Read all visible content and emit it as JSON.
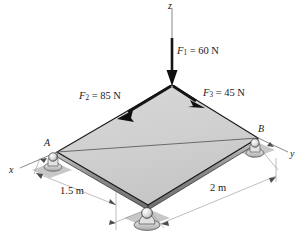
{
  "figure": {
    "axes": {
      "z_label": "z",
      "x_label": "x",
      "y_label": "y"
    },
    "points": [
      {
        "id": "A",
        "label": "A"
      },
      {
        "id": "B",
        "label": "B"
      }
    ],
    "forces": [
      {
        "id": "F1",
        "symbol": "F",
        "subscript": "1",
        "equals": " = ",
        "magnitude": "60",
        "unit": "N",
        "label": "F1 = 60 N",
        "direction": "downward along z"
      },
      {
        "id": "F2",
        "symbol": "F",
        "subscript": "2",
        "equals": " = ",
        "magnitude": "85",
        "unit": "N",
        "label": "F2 = 85 N",
        "direction": "down-left along plate edge"
      },
      {
        "id": "F3",
        "symbol": "F",
        "subscript": "3",
        "equals": " = ",
        "magnitude": "45",
        "unit": "N",
        "label": "F3 = 45 N",
        "direction": "down-right along plate edge"
      }
    ],
    "dimensions": [
      {
        "id": "d1",
        "value": "1.5",
        "unit": "m",
        "label": "1.5 m"
      },
      {
        "id": "d2",
        "value": "2",
        "unit": "m",
        "label": "2 m"
      }
    ],
    "colors": {
      "plate_fill": "#d2d2d2",
      "plate_edge": "#1a1a1a",
      "side_face": "#8e8e8e",
      "shadow": "#b8b8b8",
      "support": "#e8e8e8",
      "axis_line": "#6b6b6b",
      "arrow": "#151515"
    }
  }
}
